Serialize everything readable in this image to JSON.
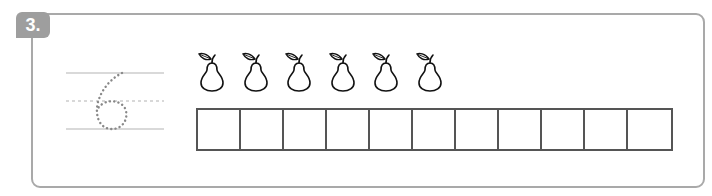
{
  "exercise": {
    "number_label": "3.",
    "traced_digit": "6",
    "pear_count": 6,
    "box_count": 11,
    "colors": {
      "badge": "#9e9e9e",
      "frame": "#a9a9a9",
      "guide_lines": "#cccccc",
      "dots": "#888888",
      "grid": "#555555"
    },
    "icons": {
      "fruit": "pear-icon"
    }
  }
}
